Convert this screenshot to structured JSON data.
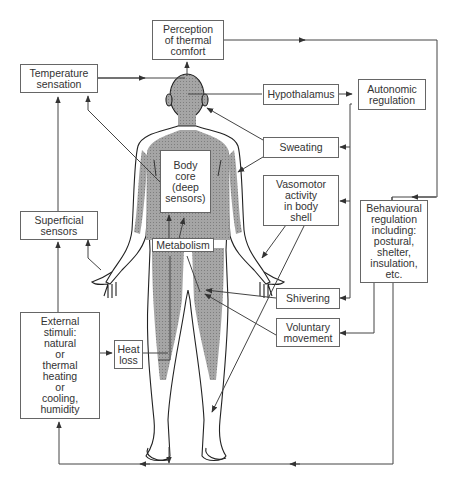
{
  "diagram": {
    "type": "thermoregulation-flow",
    "colors": {
      "line": "#444444",
      "box_border": "#666666",
      "body_shading": "#9a9a9a",
      "body_outline": "#222222",
      "text": "#333333"
    },
    "boxes": {
      "perception": "Perception\nof thermal\ncomfort",
      "temperature_sensation": "Temperature\nsensation",
      "hypothalamus": "Hypothalamus",
      "autonomic_regulation": "Autonomic\nregulation",
      "sweating": "Sweating",
      "body_core": "Body\ncore\n(deep\nsensors)",
      "vasomotor": "Vasomotor\nactivity\nin body\nshell",
      "superficial_sensors": "Superficial\nsensors",
      "metabolism": "Metabolism",
      "behavioural": "Behavioural\nregulation\nincluding:\npostural,\nshelter,\ninsulation,\netc.",
      "shivering": "Shivering",
      "voluntary_movement": "Voluntary\nmovement",
      "external_stimuli": "External\nstimuli:\nnatural\nor\nthermal\nheating\nor\ncooling,\nhumidity",
      "heat_loss": "Heat\nloss"
    }
  }
}
